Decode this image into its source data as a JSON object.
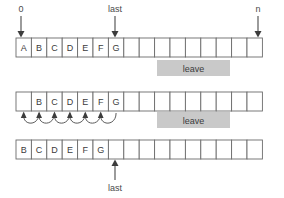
{
  "figure": {
    "colors": {
      "cell_stroke": "#6b6b6b",
      "cell_fill": "#ffffff",
      "leave_box": "#c9c9c9",
      "text": "#3c3c3c",
      "arrow": "#3c3c3c",
      "background": "#ffffff"
    }
  },
  "chart_data": {
    "type": "diagram",
    "cell_count": 16,
    "rows": [
      {
        "id": "row-initial",
        "cells": [
          "A",
          "B",
          "C",
          "D",
          "E",
          "F",
          "G",
          "",
          "",
          "",
          "",
          "",
          "",
          "",
          "",
          ""
        ],
        "pointers": [
          {
            "label": "0",
            "cell_index": 0,
            "direction": "down"
          },
          {
            "label": "last",
            "cell_index": 6,
            "direction": "down"
          },
          {
            "label": "n",
            "cell_index": 15,
            "direction": "down"
          }
        ]
      },
      {
        "id": "row-shifting",
        "cells": [
          "",
          "B",
          "C",
          "D",
          "E",
          "F",
          "G",
          "",
          "",
          "",
          "",
          "",
          "",
          "",
          "",
          ""
        ],
        "shift_arcs": 6,
        "shift_from_indices": [
          1,
          2,
          3,
          4,
          5,
          6
        ],
        "shift_to_indices": [
          0,
          1,
          2,
          3,
          4,
          5
        ],
        "pointers": []
      },
      {
        "id": "row-final",
        "cells": [
          "B",
          "C",
          "D",
          "E",
          "F",
          "G",
          "",
          "",
          "",
          "",
          "",
          "",
          "",
          "",
          "",
          ""
        ],
        "pointers": [
          {
            "label": "last",
            "cell_index": 5,
            "direction": "up"
          }
        ]
      }
    ],
    "annotations": [
      {
        "id": "leave-top",
        "label": "leave",
        "x": 157,
        "y": 60,
        "width": 73,
        "height": 16
      },
      {
        "id": "leave-bottom",
        "label": "leave",
        "x": 157,
        "y": 112,
        "width": 73,
        "height": 16
      }
    ]
  },
  "labels": {
    "index_zero": "0",
    "index_last": "last",
    "index_n": "n",
    "index_last_final": "last",
    "leave_top": "leave",
    "leave_bottom": "leave"
  },
  "row1_cells": [
    "A",
    "B",
    "C",
    "D",
    "E",
    "F",
    "G",
    "",
    "",
    "",
    "",
    "",
    "",
    "",
    "",
    ""
  ],
  "row2_cells": [
    "",
    "B",
    "C",
    "D",
    "E",
    "F",
    "G",
    "",
    "",
    "",
    "",
    "",
    "",
    "",
    "",
    ""
  ],
  "row3_cells": [
    "B",
    "C",
    "D",
    "E",
    "F",
    "G",
    "",
    "",
    "",
    "",
    "",
    "",
    "",
    "",
    "",
    ""
  ]
}
